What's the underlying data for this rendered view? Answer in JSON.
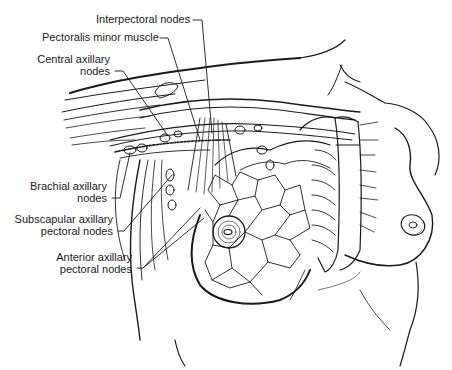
{
  "figure": {
    "type": "anatomical line illustration",
    "stroke_color": "#1a1a1a",
    "background": "#ffffff"
  },
  "labels": [
    {
      "id": "interpectoral",
      "text": "Interpectoral nodes"
    },
    {
      "id": "pectoralis_minor",
      "text": "Pectoralis minor muscle"
    },
    {
      "id": "central_axillary_l1",
      "text": "Central axillary"
    },
    {
      "id": "central_axillary_l2",
      "text": "nodes"
    },
    {
      "id": "brachial_axillary_l1",
      "text": "Brachial axillary"
    },
    {
      "id": "brachial_axillary_l2",
      "text": "nodes"
    },
    {
      "id": "subscapular_l1",
      "text": "Subscapular axillary"
    },
    {
      "id": "subscapular_l2",
      "text": "pectoral nodes"
    },
    {
      "id": "anterior_l1",
      "text": "Anterior axillary"
    },
    {
      "id": "anterior_l2",
      "text": "pectoral nodes"
    }
  ],
  "labels_by_id": {
    "interpectoral": "Interpectoral nodes",
    "pectoralis_minor": "Pectoralis minor muscle",
    "central_1": "Central axillary",
    "central_2": "nodes",
    "brachial_1": "Brachial axillary",
    "brachial_2": "nodes",
    "subscapular_1": "Subscapular axillary",
    "subscapular_2": "pectoral nodes",
    "anterior_1": "Anterior axillary",
    "anterior_2": "pectoral nodes"
  }
}
